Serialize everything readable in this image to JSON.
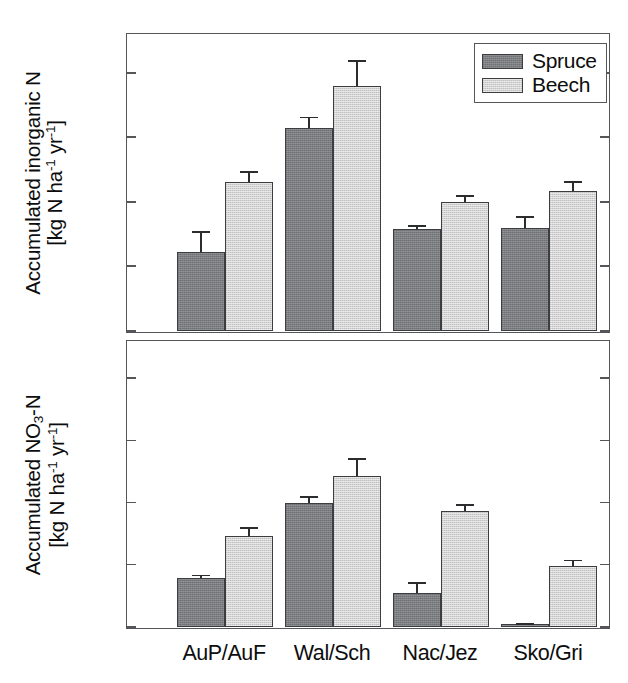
{
  "figure": {
    "background": "#ffffff",
    "panel_border_color": "#55565a",
    "spruce_color": "#7c7d80",
    "beech_color": "#d2d3d2"
  },
  "legend": {
    "position": "top-right",
    "entries": [
      {
        "label": "Spruce",
        "swatch": "spruce-swatch",
        "color": "#7c7d80"
      },
      {
        "label": "Beech",
        "swatch": "beech-swatch",
        "color": "#d2d3d2"
      }
    ]
  },
  "chart_data": [
    {
      "type": "bar",
      "panel": "top",
      "title": "",
      "xlabel": "",
      "ylabel": "Accumulated inorganic N [kg N ha-1 yr-1]",
      "ylabel_line1": "Accumulated inorganic N",
      "ylabel_line2": "[kg N ha⁻¹ yr⁻¹]",
      "categories": [
        "AuP/AuF",
        "Wal/Sch",
        "Nac/Jez",
        "Sko/Gri"
      ],
      "ylim": [
        0,
        230
      ],
      "yticks": [
        0,
        50,
        100,
        150,
        200
      ],
      "ytick_labels": [
        "0",
        "50",
        "100",
        "150",
        "200"
      ],
      "grid": false,
      "series": [
        {
          "name": "Spruce",
          "values": [
            61,
            157,
            79,
            80
          ],
          "errors": [
            16,
            9,
            3,
            9
          ]
        },
        {
          "name": "Beech",
          "values": [
            115,
            190,
            100,
            108
          ],
          "errors": [
            9,
            20,
            5,
            8
          ]
        }
      ]
    },
    {
      "type": "bar",
      "panel": "bottom",
      "title": "",
      "xlabel": "",
      "ylabel": "Accumulated NO3-N [kg N ha-1 yr-1]",
      "ylabel_line1": "Accumulated NO₃-N",
      "ylabel_line2": "[kg N ha⁻¹ yr⁻¹]",
      "categories": [
        "AuP/AuF",
        "Wal/Sch",
        "Nac/Jez",
        "Sko/Gri"
      ],
      "ylim": [
        0,
        230
      ],
      "yticks": [
        0,
        50,
        100,
        150,
        200
      ],
      "ytick_labels": [
        "0",
        "50",
        "100",
        "150",
        "200"
      ],
      "grid": false,
      "series": [
        {
          "name": "Spruce",
          "values": [
            39,
            100,
            27,
            2
          ],
          "errors": [
            3,
            5,
            9,
            1
          ]
        },
        {
          "name": "Beech",
          "values": [
            73,
            121,
            93,
            49
          ],
          "errors": [
            7,
            15,
            6,
            5
          ]
        }
      ]
    }
  ]
}
